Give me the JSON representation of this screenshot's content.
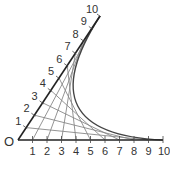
{
  "diagram": {
    "origin_label": "O",
    "slant_axis_labels": [
      "1",
      "2",
      "3",
      "4",
      "5",
      "6",
      "7",
      "8",
      "9",
      "10"
    ],
    "base_axis_labels": [
      "1",
      "2",
      "3",
      "4",
      "5",
      "6",
      "7",
      "8",
      "9",
      "10"
    ],
    "connections": "slant point i joined to base point (10 - i)",
    "colors": {
      "axis": "#222222",
      "string": "#888888",
      "envelope": "#444444",
      "text": "#333333"
    }
  }
}
